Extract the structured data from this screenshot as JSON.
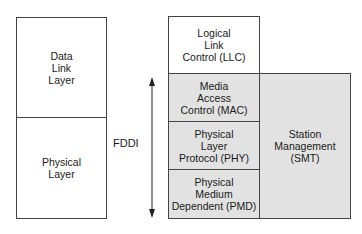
{
  "left_stack": {
    "data_link_layer": "Data\nLink\nLayer",
    "physical_layer": "Physical\nLayer"
  },
  "fddi": {
    "label": "FDDI",
    "llc": "Logical\nLink\nControl (LLC)",
    "mac": "Media\nAccess\nControl (MAC)",
    "phy": "Physical\nLayer\nProtocol (PHY)",
    "pmd": "Physical\nMedium\nDependent (PMD)",
    "smt": "Station\nManagement\n(SMT)"
  },
  "colors": {
    "shaded": "#e2e2e2",
    "border": "#444444"
  }
}
